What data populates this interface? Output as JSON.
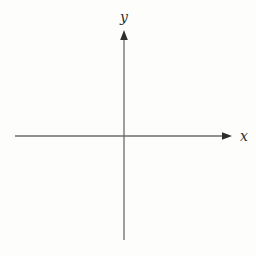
{
  "diagram": {
    "type": "coordinate-axes",
    "x_axis_label": "x",
    "y_axis_label": "y",
    "line_color": "#6b6b6b",
    "arrow_color": "#2e2e2e",
    "label_color": "#2e2e2e",
    "background_color": "#fdfdfc",
    "origin_px": {
      "x": 124,
      "y": 136
    },
    "x_axis_extent_px": {
      "from": 15,
      "to": 232
    },
    "y_axis_extent_px": {
      "from": 30,
      "to": 240
    },
    "tick_marks": [],
    "grid": "off"
  }
}
